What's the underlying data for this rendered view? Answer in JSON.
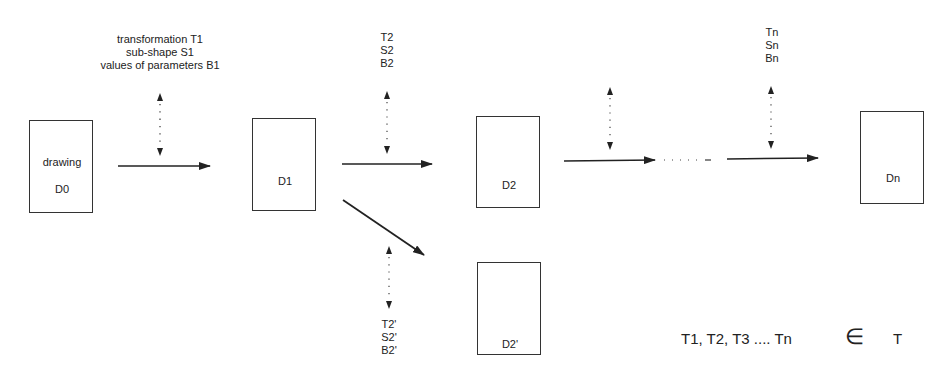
{
  "diagram": {
    "type": "transformation sequence",
    "nodes": [
      {
        "id": "D0",
        "caption": "drawing",
        "label": "D0"
      },
      {
        "id": "D1",
        "label": "D1"
      },
      {
        "id": "D2",
        "label": "D2"
      },
      {
        "id": "D2p",
        "label": "D2'"
      },
      {
        "id": "Dn",
        "label": "Dn"
      }
    ],
    "annotations": {
      "step1": [
        "transformation T1",
        "sub-shape S1",
        "values of parameters B1"
      ],
      "step2": [
        "T2",
        "S2",
        "B2"
      ],
      "step2p": [
        "T2'",
        "S2'",
        "B2'"
      ],
      "stepn": [
        "Tn",
        "Sn",
        "Bn"
      ]
    },
    "ellipsis": "· · · · · –",
    "formula": {
      "lhs": "T1, T2, T3 ....  Tn",
      "symbol": "∈",
      "rhs": "T"
    },
    "edges": [
      {
        "from": "D0",
        "to": "D1"
      },
      {
        "from": "D1",
        "to": "D2"
      },
      {
        "from": "D1",
        "to": "D2p"
      },
      {
        "from": "D2",
        "to": "..."
      },
      {
        "from": "...",
        "to": "Dn"
      }
    ]
  }
}
